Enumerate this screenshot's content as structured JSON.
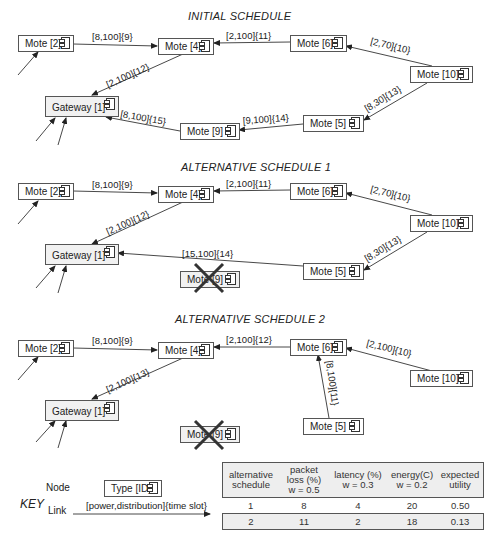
{
  "sections": [
    {
      "title": "INITIAL SCHEDULE",
      "nodes": {
        "mote2": "Mote [2]",
        "mote4": "Mote [4]",
        "mote6": "Mote [6]",
        "mote10": "Mote [10]",
        "mote5": "Mote [5]",
        "mote9": "Mote [9]",
        "gateway": "Gateway [1]"
      },
      "links": {
        "m2_m4": "[8,100]{9}",
        "m6_m4": "[2,100]{11}",
        "m10_m6": "[2,70]{10}",
        "m4_gw": "[2,100]{12}",
        "m10_m5": "[8,30]{13}",
        "m5_m9": "[9,100]{14}",
        "m9_gw": "[8,100]{15}"
      }
    },
    {
      "title": "ALTERNATIVE SCHEDULE 1",
      "nodes": {
        "mote2": "Mote [2]",
        "mote4": "Mote [4]",
        "mote6": "Mote [6]",
        "mote10": "Mote [10]",
        "mote5": "Mote [5]",
        "mote9": "Mote [9]",
        "gateway": "Gateway [1]"
      },
      "failed_node": "Mote [9]",
      "links": {
        "m2_m4": "[8,100]{9}",
        "m6_m4": "[2,100]{11}",
        "m10_m6": "[2,70]{10}",
        "m4_gw": "[2,100]{12}",
        "m10_m5": "[8,30]{13}",
        "m5_gw": "[15,100]{14}"
      }
    },
    {
      "title": "ALTERNATIVE SCHEDULE 2",
      "nodes": {
        "mote2": "Mote [2]",
        "mote4": "Mote [4]",
        "mote6": "Mote [6]",
        "mote10": "Mote [10]",
        "mote5": "Mote [5]",
        "mote9": "Mote [9]",
        "gateway": "Gateway [1]"
      },
      "failed_node": "Mote [9]",
      "links": {
        "m2_m4": "[8,100]{9}",
        "m6_m4": "[2,100]{12}",
        "m10_m6": "[2,100]{10}",
        "m4_gw": "[2,100]{13}",
        "m5_m6": "[8,100]{11}"
      }
    }
  ],
  "key": {
    "title": "KEY",
    "node_label": "Node",
    "node_example": "Type [ID]",
    "link_label": "Link",
    "link_example": "[power,distribution]{time slot}"
  },
  "utility_table": {
    "headers": {
      "schedule": "alternative schedule",
      "packet_loss_1": "packet",
      "packet_loss_2": "loss (%)",
      "packet_loss_3": "w = 0.5",
      "latency_1": "latency (%)",
      "latency_2": "w = 0.3",
      "energy_1": "energy(C)",
      "energy_2": "w = 0.2",
      "utility_1": "expected",
      "utility_2": "utility"
    },
    "rows": [
      {
        "schedule": "1",
        "packet_loss": "8",
        "latency": "4",
        "energy": "20",
        "utility": "0.50"
      },
      {
        "schedule": "2",
        "packet_loss": "11",
        "latency": "2",
        "energy": "18",
        "utility": "0.13"
      }
    ]
  },
  "colors": {
    "line": "#333333",
    "node_border": "#555555",
    "gateway_fill": "#f1f1f1",
    "table_header": "#eeeeee"
  }
}
